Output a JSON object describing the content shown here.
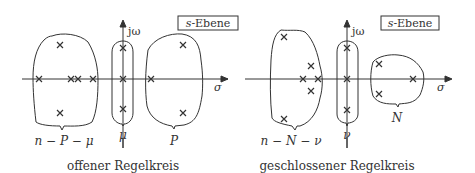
{
  "left": {
    "plane_label_var": "s",
    "plane_label_rest": "-Ebene",
    "axis_imag": "jω",
    "axis_real": "σ",
    "group_left": "n − P − μ",
    "group_mid": "μ",
    "group_right": "P",
    "caption": "offener Regelkreis"
  },
  "right": {
    "plane_label_var": "s",
    "plane_label_rest": "-Ebene",
    "axis_imag": "jω",
    "axis_real": "σ",
    "group_left": "n − N − ν",
    "group_mid": "ν",
    "group_right": "N",
    "caption": "geschlossener Regelkreis"
  },
  "colors": {
    "line": "#333333",
    "background": "#ffffff"
  }
}
